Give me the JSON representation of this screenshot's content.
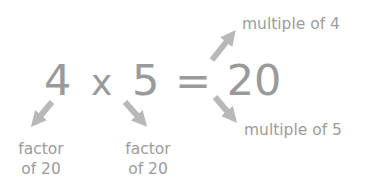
{
  "equation": {
    "left_factor": "4",
    "times": "x",
    "right_factor": "5",
    "equals": "=",
    "product": "20"
  },
  "labels": {
    "multiple_of_4": "multiple of 4",
    "multiple_of_5": "multiple of 5",
    "factor_left": {
      "line1": "factor",
      "line2": "of 20"
    },
    "factor_middle": {
      "line1": "factor",
      "line2": "of 20"
    }
  },
  "colors": {
    "text": "#9a9a9a",
    "arrow": "#b8b8b8",
    "background": "#ffffff"
  }
}
